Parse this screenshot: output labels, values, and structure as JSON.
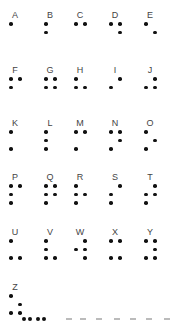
{
  "chart_data": {
    "type": "table",
    "letters": [
      {
        "letter": "A",
        "dots": [
          1
        ]
      },
      {
        "letter": "B",
        "dots": [
          1,
          2
        ]
      },
      {
        "letter": "C",
        "dots": [
          1,
          4
        ]
      },
      {
        "letter": "D",
        "dots": [
          1,
          4,
          5
        ]
      },
      {
        "letter": "E",
        "dots": [
          1,
          5
        ]
      },
      {
        "letter": "F",
        "dots": [
          1,
          2,
          4
        ]
      },
      {
        "letter": "G",
        "dots": [
          1,
          2,
          4,
          5
        ]
      },
      {
        "letter": "H",
        "dots": [
          1,
          2,
          5
        ]
      },
      {
        "letter": "I",
        "dots": [
          2,
          4
        ]
      },
      {
        "letter": "J",
        "dots": [
          2,
          4,
          5
        ]
      },
      {
        "letter": "K",
        "dots": [
          1,
          3
        ]
      },
      {
        "letter": "L",
        "dots": [
          1,
          2,
          3
        ]
      },
      {
        "letter": "M",
        "dots": [
          1,
          3,
          4
        ]
      },
      {
        "letter": "N",
        "dots": [
          1,
          3,
          4,
          5
        ]
      },
      {
        "letter": "O",
        "dots": [
          1,
          3,
          5
        ]
      },
      {
        "letter": "P",
        "dots": [
          1,
          2,
          3,
          4
        ]
      },
      {
        "letter": "Q",
        "dots": [
          1,
          2,
          3,
          4,
          5
        ]
      },
      {
        "letter": "R",
        "dots": [
          1,
          2,
          3,
          5
        ]
      },
      {
        "letter": "S",
        "dots": [
          2,
          3,
          4
        ]
      },
      {
        "letter": "T",
        "dots": [
          2,
          3,
          4,
          5
        ]
      },
      {
        "letter": "U",
        "dots": [
          1,
          3,
          6
        ]
      },
      {
        "letter": "V",
        "dots": [
          1,
          2,
          3,
          6
        ]
      },
      {
        "letter": "W",
        "dots": [
          2,
          4,
          5,
          6
        ]
      },
      {
        "letter": "X",
        "dots": [
          1,
          3,
          4,
          6
        ]
      },
      {
        "letter": "Y",
        "dots": [
          1,
          3,
          4,
          5,
          6
        ]
      },
      {
        "letter": "Z",
        "dots": [
          1,
          3,
          5,
          6
        ]
      }
    ]
  }
}
